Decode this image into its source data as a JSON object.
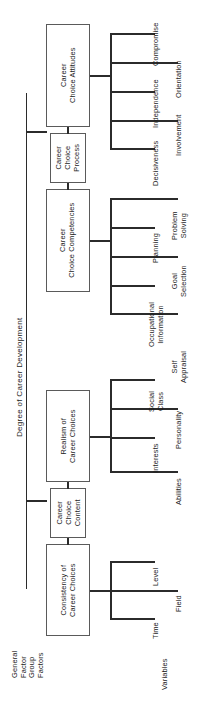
{
  "diagram": {
    "title": "Degree of Career Development",
    "type": "hierarchical-tree",
    "orientation": "rotated-90",
    "line_color": "#2b2b2b",
    "box_border_color": "#5a5a5a",
    "background": "#ffffff"
  },
  "tier_labels": {
    "general_factor": "General\nFactor",
    "group_factors": "Group\nFactors",
    "variables": "Variables"
  },
  "root": {
    "label": "Degree of Career Development"
  },
  "groups": [
    {
      "id": "career-choice-attitudes",
      "label": "Career\nChoice Attitudes",
      "leaves": [
        {
          "label": "Compromise",
          "column": "near"
        },
        {
          "label": "Orientation",
          "column": "far"
        },
        {
          "label": "Independence",
          "column": "near"
        },
        {
          "label": "Involvement",
          "column": "far"
        },
        {
          "label": "Decisiveness",
          "column": "near"
        }
      ]
    },
    {
      "id": "career-choice-process",
      "label": "Career\nChoice\nProcess",
      "leaves": []
    },
    {
      "id": "career-choice-competencies",
      "label": "Career\nChoice Competencies",
      "leaves": [
        {
          "label": "Problem\nSolving",
          "column": "far"
        },
        {
          "label": "Planning",
          "column": "near"
        },
        {
          "label": "Goal\nSelection",
          "column": "far"
        },
        {
          "label": "Occupational\nInformation",
          "column": "near"
        },
        {
          "label": "Self\nAppraisal",
          "column": "far"
        }
      ]
    },
    {
      "id": "realism-of-career-choices",
      "label": "Realism of\nCareer Choices",
      "leaves": [
        {
          "label": "Social\nClass",
          "column": "near"
        },
        {
          "label": "Personality",
          "column": "far"
        },
        {
          "label": "Interests",
          "column": "near"
        },
        {
          "label": "Abilities",
          "column": "far"
        }
      ]
    },
    {
      "id": "career-choice-content",
      "label": "Career\nChoice\nContent",
      "leaves": []
    },
    {
      "id": "consistency-of-career-choices",
      "label": "Consistency of\nCareer Choices",
      "leaves": [
        {
          "label": "Level",
          "column": "near"
        },
        {
          "label": "Field",
          "column": "far"
        },
        {
          "label": "Time",
          "column": "near"
        }
      ]
    }
  ]
}
